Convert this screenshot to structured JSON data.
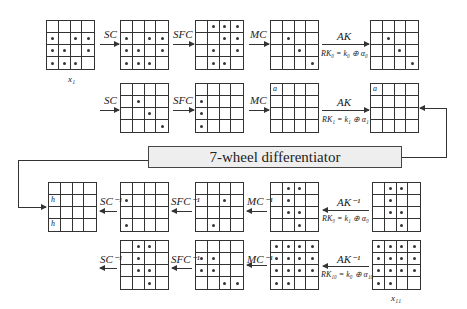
{
  "differentiator": {
    "label": "7-wheel differentiator"
  },
  "rows": [
    {
      "name": "forward-round-0",
      "grids": [
        {
          "label": "x_1",
          "cells": [
            0,
            0,
            0,
            0,
            1,
            0,
            1,
            1,
            1,
            1,
            0,
            1,
            1,
            1,
            1,
            0
          ]
        },
        {
          "cells": [
            0,
            0,
            0,
            0,
            1,
            0,
            1,
            1,
            1,
            1,
            0,
            1,
            1,
            1,
            1,
            0
          ]
        },
        {
          "cells": [
            0,
            1,
            1,
            1,
            0,
            0,
            1,
            1,
            0,
            1,
            0,
            1,
            0,
            1,
            1,
            0
          ]
        },
        {
          "cells": [
            0,
            0,
            0,
            0,
            0,
            1,
            0,
            0,
            0,
            0,
            1,
            0,
            0,
            0,
            0,
            1
          ]
        },
        {
          "cells": [
            0,
            0,
            0,
            0,
            0,
            1,
            0,
            0,
            0,
            0,
            1,
            0,
            0,
            0,
            0,
            1
          ]
        }
      ],
      "ops": [
        {
          "label": "SC",
          "direction": "right"
        },
        {
          "label": "SFC",
          "direction": "right"
        },
        {
          "label": "MC",
          "direction": "right"
        },
        {
          "label": "AK",
          "sublabel": "RK₀ = k₀ ⊕ α₀",
          "direction": "right"
        }
      ]
    },
    {
      "name": "forward-round-1",
      "grids": [
        {
          "cells": [
            0,
            0,
            0,
            0,
            0,
            1,
            0,
            0,
            0,
            0,
            1,
            0,
            0,
            0,
            0,
            1
          ]
        },
        {
          "cells": [
            0,
            0,
            0,
            0,
            1,
            0,
            0,
            0,
            1,
            0,
            0,
            0,
            1,
            0,
            0,
            0
          ]
        },
        {
          "cells": [
            0,
            0,
            0,
            0,
            0,
            0,
            0,
            0,
            0,
            0,
            0,
            0,
            0,
            0,
            0,
            0
          ],
          "cell_label": "a"
        },
        {
          "cells": [
            0,
            0,
            0,
            0,
            0,
            0,
            0,
            0,
            0,
            0,
            0,
            0,
            0,
            0,
            0,
            0
          ],
          "cell_label": "a"
        }
      ],
      "ops": [
        {
          "label": "SC",
          "direction": "right"
        },
        {
          "label": "SFC",
          "direction": "right"
        },
        {
          "label": "MC",
          "direction": "right"
        },
        {
          "label": "AK",
          "sublabel": "RK₁ = k₁ ⊕ α₁",
          "direction": "right"
        }
      ]
    },
    {
      "name": "backward-round-9",
      "grids": [
        {
          "cells": [
            0,
            0,
            0,
            0,
            0,
            0,
            0,
            0,
            0,
            0,
            0,
            0,
            0,
            0,
            0,
            0
          ],
          "cell_label": "h",
          "label_cells": [
            4,
            12
          ]
        },
        {
          "cells": [
            0,
            0,
            0,
            0,
            1,
            0,
            0,
            0,
            0,
            0,
            0,
            0,
            1,
            0,
            0,
            0
          ]
        },
        {
          "cells": [
            0,
            0,
            0,
            0,
            0,
            0,
            1,
            0,
            0,
            0,
            0,
            0,
            0,
            1,
            0,
            0
          ]
        },
        {
          "cells": [
            0,
            1,
            1,
            0,
            0,
            1,
            0,
            0,
            0,
            1,
            1,
            0,
            0,
            0,
            1,
            0
          ]
        },
        {
          "cells": [
            0,
            1,
            1,
            0,
            0,
            1,
            0,
            0,
            0,
            1,
            1,
            0,
            0,
            0,
            1,
            0
          ]
        }
      ],
      "ops": [
        {
          "label": "SC⁻¹",
          "direction": "left"
        },
        {
          "label": "SFC⁻¹",
          "direction": "left"
        },
        {
          "label": "MC⁻¹",
          "direction": "left"
        },
        {
          "label": "AK⁻¹",
          "sublabel": "RK₉ = k₁ ⊕ α₉",
          "direction": "left"
        }
      ]
    },
    {
      "name": "backward-round-10",
      "grids": [
        {
          "cells": [
            0,
            1,
            1,
            0,
            0,
            1,
            0,
            0,
            0,
            1,
            1,
            0,
            0,
            0,
            1,
            0
          ]
        },
        {
          "cells": [
            0,
            0,
            0,
            0,
            1,
            1,
            0,
            0,
            1,
            1,
            0,
            0,
            0,
            0,
            1,
            1
          ]
        },
        {
          "cells": [
            1,
            1,
            1,
            1,
            1,
            1,
            1,
            1,
            1,
            1,
            1,
            1,
            1,
            1,
            0,
            0
          ]
        },
        {
          "label": "x_11",
          "cells": [
            1,
            1,
            1,
            1,
            1,
            1,
            1,
            1,
            1,
            1,
            1,
            1,
            1,
            1,
            0,
            0
          ]
        }
      ],
      "ops": [
        {
          "label": "SC⁻¹",
          "direction": "left"
        },
        {
          "label": "SFC⁻¹",
          "direction": "left"
        },
        {
          "label": "MC⁻¹",
          "direction": "left"
        },
        {
          "label": "AK⁻¹",
          "sublabel": "RK₁₀ = k₀ ⊕ α₁₀",
          "direction": "left"
        }
      ]
    }
  ],
  "labels": {
    "x1": "x₁",
    "x11": "x₁₁",
    "r1_op1": "SC",
    "r1_op2": "SFC",
    "r1_op3": "MC",
    "r1_op4": "AK",
    "r1_sub4": "RK₀ = k₀ ⊕ α₀",
    "r2_op1": "SC",
    "r2_op2": "SFC",
    "r2_op3": "MC",
    "r2_op4": "AK",
    "r2_sub4": "RK₁ = k₁ ⊕ α₁",
    "r3_op1": "SC⁻¹",
    "r3_op2": "SFC⁻¹",
    "r3_op3": "MC⁻¹",
    "r3_op4": "AK⁻¹",
    "r3_sub4": "RK₉ = k₁ ⊕ α₉",
    "r4_op1": "SC⁻¹",
    "r4_op2": "SFC⁻¹",
    "r4_op3": "MC⁻¹",
    "r4_op4": "AK⁻¹",
    "r4_sub4": "RK₁₀ = k₀ ⊕ α₁₀",
    "cell_a": "a",
    "cell_h": "h"
  }
}
